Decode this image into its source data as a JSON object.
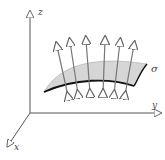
{
  "diagram": {
    "axes": {
      "x_label": "x",
      "y_label": "y",
      "z_label": "z"
    },
    "surface_label": "σ",
    "normal_vector_count": 6,
    "colors": {
      "surface_fill": "#d6d6d6",
      "axis": "#555555",
      "edge": "#111111",
      "arrow": "#777777"
    }
  }
}
